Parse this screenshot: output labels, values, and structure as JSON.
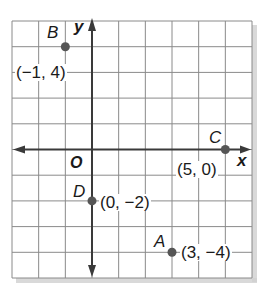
{
  "figure": {
    "type": "coordinate-plane",
    "grid": {
      "x_min": -3,
      "x_max": 6,
      "y_min": -5,
      "y_max": 5,
      "unit": 1
    },
    "axes": {
      "x_label": "x",
      "y_label": "y",
      "origin_label": "O"
    },
    "points": [
      {
        "name": "A",
        "x": 3,
        "y": -4,
        "coord_label": "(3, −4)"
      },
      {
        "name": "B",
        "x": -1,
        "y": 4,
        "coord_label": "(−1, 4)"
      },
      {
        "name": "C",
        "x": 5,
        "y": 0,
        "coord_label": "(5, 0)"
      },
      {
        "name": "D",
        "x": 0,
        "y": -2,
        "coord_label": "(0, −2)"
      }
    ],
    "colors": {
      "grid_line": "#8a8a8a",
      "axis": "#3a3a3a",
      "point": "#555555",
      "text": "#1a1a1a",
      "shadow": "#cfcfcf"
    }
  }
}
